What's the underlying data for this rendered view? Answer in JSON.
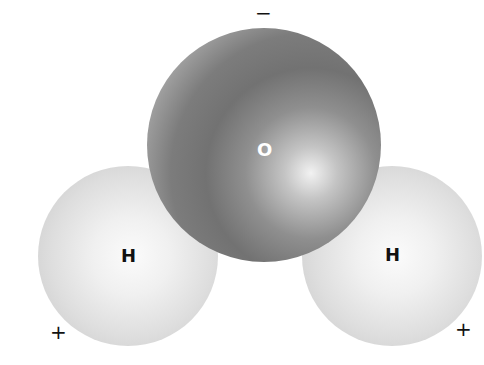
{
  "diagram": {
    "atoms": [
      {
        "id": "oxygen",
        "label": "O",
        "color": "#727272"
      },
      {
        "id": "hydrogen-left",
        "label": "H",
        "color": "#e6e6e6"
      },
      {
        "id": "hydrogen-right",
        "label": "H",
        "color": "#e6e6e6"
      }
    ],
    "charges": {
      "oxygen_side": "−",
      "hydrogen_left": "+",
      "hydrogen_right": "+"
    }
  }
}
